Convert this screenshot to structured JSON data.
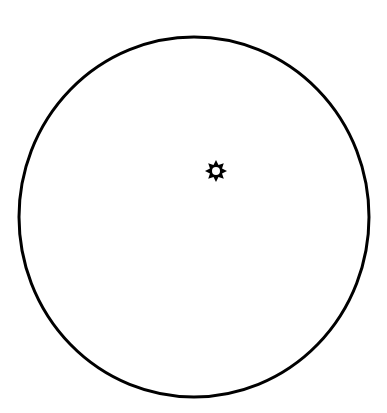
{
  "diagram": {
    "background": "#ffffff",
    "stroke_color": "#000000",
    "circle": {
      "cx": 194,
      "cy": 217,
      "rx": 175,
      "ry": 180,
      "stroke_width": 3
    },
    "sun_symbol": {
      "icon": "sun-icon",
      "cx": 216,
      "cy": 171,
      "outer_radius": 11,
      "inner_radius": 6.5,
      "hole_radius": 4,
      "points": 8
    }
  }
}
